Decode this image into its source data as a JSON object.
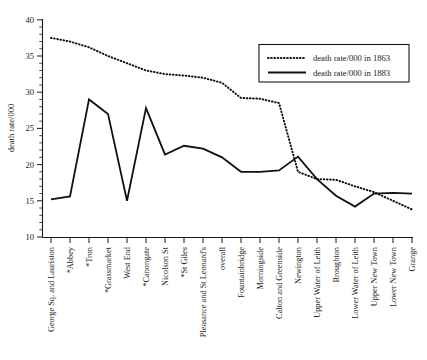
{
  "chart_data": {
    "type": "line",
    "title": "",
    "xlabel": "",
    "ylabel": "death rate/000",
    "ylim": [
      10,
      40
    ],
    "ytick_values": [
      10,
      15,
      20,
      25,
      30,
      35,
      40
    ],
    "ytick_labels": [
      "10",
      "15",
      "20",
      "25",
      "30",
      "35",
      "40"
    ],
    "grid": false,
    "legend_position": "upper right",
    "categories": [
      "George Sq. and Lauriston",
      "*Abbey",
      "*Tron",
      "*Grassmarket",
      "West End",
      "*Canongate",
      "Nicolson St",
      "*St Giles",
      "Pleasance and St Leonard's",
      "overall",
      "Fountainbridge",
      "Morningside",
      "Calton and Greenside",
      "Newington",
      "Upper Water of Leith",
      "Broughton",
      "Lower Water of Leith",
      "Upper New Town",
      "Lower New Town",
      "Grange"
    ],
    "series": [
      {
        "name": "death rate/000 in 1863",
        "style": "dotted",
        "values": [
          37.5,
          37.0,
          36.2,
          35.0,
          34.0,
          33.0,
          32.5,
          32.3,
          32.0,
          31.3,
          29.2,
          29.1,
          28.5,
          27.0,
          25.4,
          23.4,
          21.5,
          19.2,
          19.1,
          19.0
        ]
      },
      {
        "name": "death rate/000 in 1883",
        "style": "solid",
        "values": [
          15.2,
          15.6,
          29.0,
          27.0,
          15.0,
          27.8,
          21.4,
          22.6,
          22.2,
          21.0,
          19.0,
          19.0,
          19.2,
          21.1,
          18.0,
          15.7,
          14.2,
          16.3,
          16.0,
          16.0
        ]
      }
    ],
    "crossover_note": "series cross near right edge",
    "series_1863_tail": [
      19.0,
      18.0,
      17.9,
      17.0,
      16.2,
      15.0,
      13.8
    ],
    "series_1883_tail": [
      16.0,
      16.1,
      16.0
    ]
  },
  "legend": {
    "entries": [
      {
        "label": "death rate/000 in 1863",
        "style": "dotted"
      },
      {
        "label": "death rate/000 in 1883",
        "style": "solid"
      }
    ]
  },
  "axes": {
    "y_title": "death rate/000",
    "y_labels": [
      "40",
      "35",
      "30",
      "25",
      "20",
      "15",
      "10"
    ]
  }
}
